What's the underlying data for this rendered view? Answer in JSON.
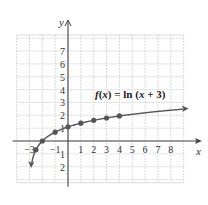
{
  "chart_data": {
    "type": "line",
    "title": "",
    "function_label": "f(x) = ln (x + 3)",
    "xlabel": "x",
    "ylabel": "y",
    "xlim": [
      -4,
      9
    ],
    "ylim": [
      -3,
      8
    ],
    "grid": true,
    "x_ticks": [
      -3,
      -1,
      1,
      2,
      3,
      4,
      5,
      6,
      7,
      8
    ],
    "y_ticks": [
      7,
      6,
      5,
      4,
      3,
      2,
      1,
      -1,
      -2
    ],
    "series": [
      {
        "name": "f(x) = ln (x + 3)",
        "curve_domain": [
          -2.95,
          9
        ],
        "asymptote_x": -3,
        "points": [
          {
            "x": -2.5,
            "y": -0.69
          },
          {
            "x": -2,
            "y": 0
          },
          {
            "x": -1,
            "y": 0.69
          },
          {
            "x": 0,
            "y": 1.1
          },
          {
            "x": 1,
            "y": 1.39
          },
          {
            "x": 2,
            "y": 1.61
          },
          {
            "x": 3,
            "y": 1.79
          },
          {
            "x": 4,
            "y": 1.95
          }
        ]
      }
    ],
    "colors": {
      "curve": "#555555",
      "grid": "#d0d0d0",
      "axis": "#444444",
      "points": "#555555"
    }
  }
}
